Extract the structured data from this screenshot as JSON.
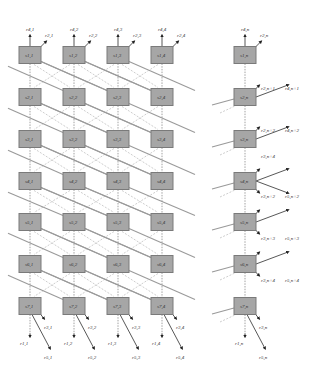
{
  "diagram": {
    "type": "tiled grid network of nodes with crossing links",
    "columns_left": [
      30,
      74,
      118,
      162
    ],
    "column_right": 245,
    "rows": [
      55,
      97,
      139,
      181,
      222,
      264,
      306
    ],
    "node_width": 22,
    "node_height": 17,
    "colors": {
      "node_fill": "#a6a6a6",
      "node_stroke": "#7a7a7a",
      "link": "#9a9a9a",
      "arrow": "#444444"
    },
    "node_labels": {
      "left": [
        [
          "s1,1",
          "s1,2",
          "s1,3",
          "s1,4"
        ],
        [
          "s2,1",
          "s2,2",
          "s2,3",
          "s2,4"
        ],
        [
          "s3,1",
          "s3,2",
          "s3,3",
          "s3,4"
        ],
        [
          "s4,1",
          "s4,2",
          "s4,3",
          "s4,4"
        ],
        [
          "s5,1",
          "s5,2",
          "s5,3",
          "s5,4"
        ],
        [
          "s6,1",
          "s6,2",
          "s6,3",
          "s6,4"
        ],
        [
          "s7,1",
          "s7,2",
          "s7,3",
          "s7,4"
        ]
      ],
      "right": [
        "s1,n",
        "s2,n",
        "s3,n",
        "s4,n",
        "s5,n",
        "s6,n",
        "s7,n"
      ]
    },
    "top_labels": [
      {
        "up": "r4,1",
        "diag": "r2,1"
      },
      {
        "up": "r4,2",
        "diag": "r2,2"
      },
      {
        "up": "r4,3",
        "diag": "r2,3"
      },
      {
        "up": "r4,4",
        "diag": "r2,4"
      },
      {
        "up": "r4,n",
        "diag": "r2,n"
      }
    ],
    "bottom_labels": [
      {
        "short": "r3,1",
        "down": "r1,1",
        "long": "r5,1"
      },
      {
        "short": "r3,2",
        "down": "r1,2",
        "long": "r5,2"
      },
      {
        "short": "r3,3",
        "down": "r1,3",
        "long": "r5,3"
      },
      {
        "short": "r3,4",
        "down": "r1,4",
        "long": "r5,4"
      },
      {
        "short": "r3,n",
        "down": "r1,n",
        "long": "r5,n"
      }
    ],
    "right_side_labels": [
      {
        "a": "r2,n+1",
        "b": "r4,n+1"
      },
      {
        "a": "r2,n+2",
        "b": "r4,n+2"
      },
      {
        "a": "r3,n+4",
        "b": ""
      },
      {
        "a": "r3,n+2",
        "b": "r5,n+2"
      },
      {
        "a": "r3,n+3",
        "b": "r5,n+3"
      },
      {
        "a": "r3,n+4",
        "b": "r5,n+4"
      }
    ]
  }
}
